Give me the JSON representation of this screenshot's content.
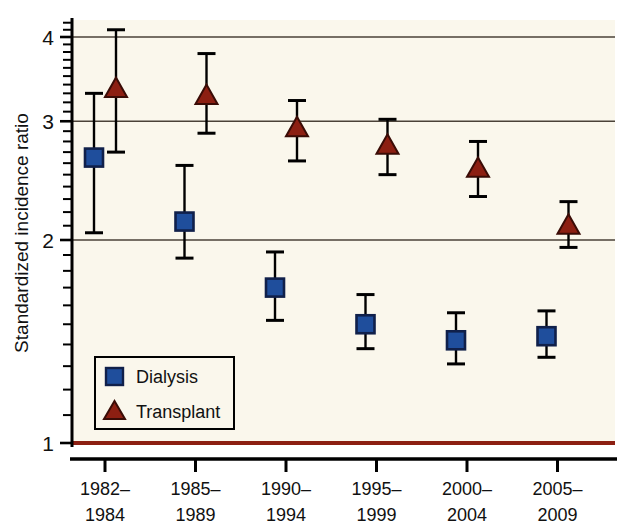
{
  "chart_data": {
    "type": "scatter",
    "title": "",
    "xlabel": "",
    "ylabel": "Standardized incidence ratio",
    "yscale": "log",
    "ylim": [
      1,
      4.35
    ],
    "ytick_labels": [
      "1",
      "2",
      "3",
      "4"
    ],
    "ytick_values": [
      1,
      2,
      3,
      4
    ],
    "grid": "horizontal gridlines at 2, 3, 4; dark red reference line at 1",
    "categories": [
      "1982–\n1984",
      "1985–\n1989",
      "1990–\n1994",
      "1995–\n1999",
      "2000–\n2004",
      "2005–\n2009"
    ],
    "category_lines": [
      [
        "1982–",
        "1984"
      ],
      [
        "1985–",
        "1989"
      ],
      [
        "1990–",
        "1994"
      ],
      [
        "1995–",
        "1999"
      ],
      [
        "2000–",
        "2004"
      ],
      [
        "2005–",
        "2009"
      ]
    ],
    "legend_position": "lower left inside axes",
    "reference_line": {
      "value": 1.0,
      "color": "#8c1f12"
    },
    "series": [
      {
        "name": "Dialysis",
        "marker": "square",
        "color": "#1f4e9c",
        "edge_color": "#10204a",
        "values": [
          2.65,
          2.13,
          1.7,
          1.5,
          1.42,
          1.44
        ],
        "ci_low": [
          2.05,
          1.88,
          1.52,
          1.38,
          1.31,
          1.34
        ],
        "ci_high": [
          3.3,
          2.58,
          1.92,
          1.66,
          1.56,
          1.57
        ]
      },
      {
        "name": "Transplant",
        "marker": "triangle",
        "color": "#8c1f12",
        "edge_color": "#3a0c06",
        "values": [
          3.35,
          3.27,
          2.93,
          2.76,
          2.55,
          2.1
        ],
        "ci_low": [
          2.7,
          2.88,
          2.62,
          2.5,
          2.32,
          1.95
        ],
        "ci_high": [
          4.1,
          3.78,
          3.22,
          3.02,
          2.8,
          2.28
        ]
      }
    ]
  },
  "legend": {
    "items": [
      {
        "label": "Dialysis",
        "marker": "square"
      },
      {
        "label": "Transplant",
        "marker": "triangle"
      }
    ]
  },
  "colors": {
    "dialysis": "#1f4e9c",
    "transplant": "#8c1f12",
    "plot_background": "#faf7ec",
    "axis": "#000000",
    "gridline": "#4a4238"
  }
}
